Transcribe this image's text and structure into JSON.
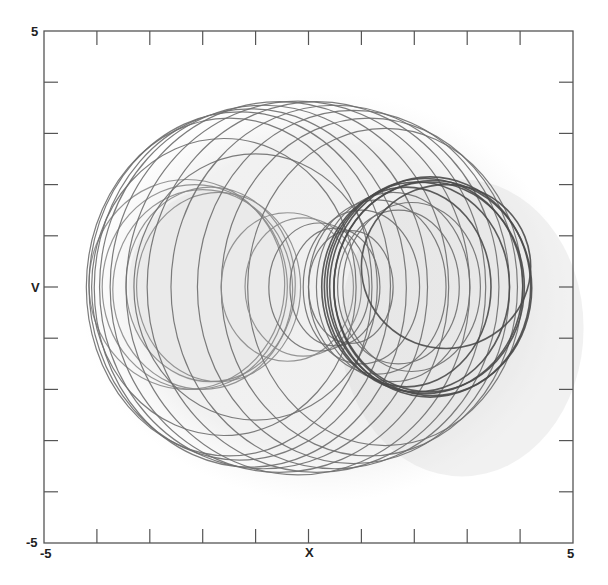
{
  "chart_data": {
    "type": "line",
    "subtype": "phase-portrait",
    "title": "",
    "xlabel": "X",
    "ylabel": "V",
    "xlim": [
      -5,
      5
    ],
    "ylim": [
      -5,
      5
    ],
    "x_tick_labels": [
      "-5",
      "5"
    ],
    "y_tick_labels": [
      "-5",
      "5"
    ],
    "x_ticks": [
      -4,
      -3,
      -2,
      -1,
      0,
      1,
      2,
      3,
      4
    ],
    "y_ticks": [
      -4,
      -3,
      -2,
      -1,
      0,
      1,
      2,
      3,
      4
    ],
    "grid": false,
    "legend": null,
    "envelope": {
      "x_min": -4.2,
      "x_max": 4.2,
      "v_min": -3.7,
      "v_max": 3.65
    },
    "colors": {
      "trajectory": "#6e6e6e",
      "trajectory_dark": "#4a4a4a",
      "haze": "#d8d8d8",
      "axis": "#555555"
    },
    "loops": [
      {
        "cx": -2.3,
        "cy": 0.05,
        "rx": 1.85,
        "ry": 2.05,
        "shade": "light"
      },
      {
        "cx": -2.15,
        "cy": 0.0,
        "rx": 1.75,
        "ry": 2.0,
        "shade": "light"
      },
      {
        "cx": -2.0,
        "cy": -0.05,
        "rx": 1.7,
        "ry": 1.95,
        "shade": "light"
      },
      {
        "cx": -1.85,
        "cy": 0.05,
        "rx": 1.6,
        "ry": 1.9,
        "shade": "light"
      },
      {
        "cx": -1.7,
        "cy": 0.0,
        "rx": 1.55,
        "ry": 1.85,
        "shade": "light"
      },
      {
        "cx": -1.5,
        "cy": 0.0,
        "rx": 2.7,
        "ry": 3.3,
        "shade": "mid"
      },
      {
        "cx": -1.3,
        "cy": 0.02,
        "rx": 2.85,
        "ry": 3.4,
        "shade": "mid"
      },
      {
        "cx": -1.1,
        "cy": -0.02,
        "rx": 2.95,
        "ry": 3.5,
        "shade": "mid"
      },
      {
        "cx": -0.85,
        "cy": 0.0,
        "rx": 3.1,
        "ry": 3.55,
        "shade": "mid"
      },
      {
        "cx": -0.55,
        "cy": 0.0,
        "rx": 3.2,
        "ry": 3.62,
        "shade": "mid"
      },
      {
        "cx": -0.2,
        "cy": -0.02,
        "rx": 3.25,
        "ry": 3.65,
        "shade": "mid"
      },
      {
        "cx": 0.15,
        "cy": 0.0,
        "rx": 3.2,
        "ry": 3.62,
        "shade": "mid"
      },
      {
        "cx": 0.5,
        "cy": 0.0,
        "rx": 3.1,
        "ry": 3.55,
        "shade": "mid"
      },
      {
        "cx": 0.85,
        "cy": 0.0,
        "rx": 2.95,
        "ry": 3.45,
        "shade": "mid"
      },
      {
        "cx": 1.15,
        "cy": 0.0,
        "rx": 2.8,
        "ry": 3.3,
        "shade": "mid"
      },
      {
        "cx": 1.45,
        "cy": 0.0,
        "rx": 2.6,
        "ry": 3.1,
        "shade": "mid"
      },
      {
        "cx": -1.6,
        "cy": 0.0,
        "rx": 2.5,
        "ry": 2.9,
        "shade": "mid"
      },
      {
        "cx": -1.0,
        "cy": 0.0,
        "rx": 2.3,
        "ry": 2.6,
        "shade": "mid"
      },
      {
        "cx": -0.4,
        "cy": 0.0,
        "rx": 1.25,
        "ry": 1.45,
        "shade": "light"
      },
      {
        "cx": -0.1,
        "cy": 0.0,
        "rx": 1.1,
        "ry": 1.35,
        "shade": "light"
      },
      {
        "cx": 0.2,
        "cy": 0.0,
        "rx": 0.95,
        "ry": 1.25,
        "shade": "mid"
      },
      {
        "cx": 0.5,
        "cy": 0.0,
        "rx": 0.85,
        "ry": 1.15,
        "shade": "mid"
      },
      {
        "cx": 0.8,
        "cy": 0.0,
        "rx": 0.8,
        "ry": 1.1,
        "shade": "mid"
      },
      {
        "cx": 1.0,
        "cy": 0.0,
        "rx": 1.1,
        "ry": 1.5,
        "shade": "mid"
      },
      {
        "cx": 1.3,
        "cy": 0.0,
        "rx": 1.3,
        "ry": 1.7,
        "shade": "mid"
      },
      {
        "cx": 1.6,
        "cy": 0.0,
        "rx": 1.45,
        "ry": 1.85,
        "shade": "mid"
      },
      {
        "cx": 1.85,
        "cy": 0.0,
        "rx": 1.6,
        "ry": 1.95,
        "shade": "dark"
      },
      {
        "cx": 2.05,
        "cy": 0.0,
        "rx": 1.75,
        "ry": 2.05,
        "shade": "dark"
      },
      {
        "cx": 2.2,
        "cy": 0.02,
        "rx": 1.85,
        "ry": 2.1,
        "shade": "dark"
      },
      {
        "cx": 2.3,
        "cy": 0.0,
        "rx": 1.9,
        "ry": 2.15,
        "shade": "dark"
      },
      {
        "cx": 2.35,
        "cy": -0.02,
        "rx": 1.87,
        "ry": 2.1,
        "shade": "dark"
      },
      {
        "cx": 2.28,
        "cy": 0.0,
        "rx": 1.8,
        "ry": 2.05,
        "shade": "dark"
      },
      {
        "cx": 1.95,
        "cy": 0.0,
        "rx": 1.3,
        "ry": 1.65,
        "shade": "mid"
      },
      {
        "cx": 1.7,
        "cy": 0.0,
        "rx": 1.15,
        "ry": 1.5,
        "shade": "mid"
      },
      {
        "cx": 2.6,
        "cy": 0.4,
        "rx": 1.6,
        "ry": 1.6,
        "shade": "dark"
      }
    ]
  }
}
